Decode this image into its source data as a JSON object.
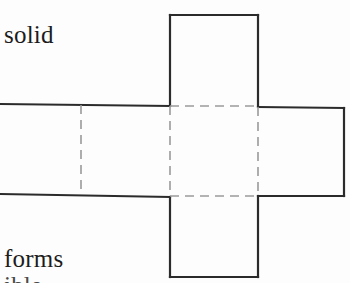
{
  "figure": {
    "name": "cube-net-cross-diagram",
    "description_labels": {
      "top_caption": "solid",
      "bottom_caption": "forms",
      "clipped_caption": "ible"
    },
    "colors": {
      "background": "#fdfdfd",
      "solid_stroke": "#2b2b2b",
      "dashed_stroke": "#9a9a9a",
      "text": "#1c1c1c"
    },
    "stroke_widths": {
      "solid": 2.2,
      "dashed": 1.6
    },
    "dash_pattern": "9 6",
    "geometry": {
      "unit": "px",
      "cell_size": 89,
      "center_square": {
        "x": 170,
        "y": 106,
        "w": 88,
        "h": 90
      },
      "top_square": {
        "x": 170,
        "y": 15,
        "w": 88,
        "h": 91
      },
      "bottom_square": {
        "x": 170,
        "y": 196,
        "w": 88,
        "h": 81
      },
      "right_square": {
        "x": 258,
        "y": 106,
        "w": 86,
        "h": 90
      },
      "left_band": {
        "x": 0,
        "y": 104,
        "w": 170,
        "h": 93
      },
      "left_dashed_divider_x": 81
    },
    "panels": [
      {
        "id": "top-face",
        "label": "top-face-square",
        "edges": "solid on three sides, dashed on shared bottom edge"
      },
      {
        "id": "center-face",
        "label": "center-face-square",
        "edges": "dashed on all four sides"
      },
      {
        "id": "bottom-face",
        "label": "bottom-face-square",
        "edges": "solid on three sides, dashed on shared top edge"
      },
      {
        "id": "right-face",
        "label": "right-face-square",
        "edges": "solid on three sides, dashed on shared left edge"
      },
      {
        "id": "left-band-near",
        "label": "left-face-square",
        "edges": "solid top and bottom, dashed on shared right edge"
      },
      {
        "id": "left-band-far",
        "label": "far-left-face-clipped",
        "edges": "solid top and bottom, clipped by image edge"
      }
    ]
  }
}
